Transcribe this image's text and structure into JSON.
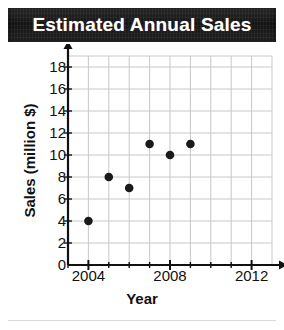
{
  "title": "Estimated Annual Sales",
  "colors": {
    "banner_background": "#141414",
    "banner_text": "#ffffff",
    "axis": "#111111",
    "grid": "#c8c8c8",
    "point": "#1a1a1a",
    "page_background": "#ffffff"
  },
  "chart_data": {
    "type": "scatter",
    "title": "Estimated Annual Sales",
    "xlabel": "Year",
    "ylabel": "Sales (million $)",
    "xlim": [
      2003,
      2013
    ],
    "ylim": [
      0,
      19
    ],
    "grid": true,
    "legend": null,
    "x_tick_labels": [
      "2004",
      "2008",
      "2012"
    ],
    "x_tick_values": [
      2004,
      2008,
      2012
    ],
    "x_minor_ticks": [
      2003,
      2004,
      2005,
      2006,
      2007,
      2008,
      2009,
      2010,
      2011,
      2012
    ],
    "y_tick_labels": [
      "0",
      "2",
      "4",
      "6",
      "8",
      "10",
      "12",
      "14",
      "16",
      "18"
    ],
    "y_tick_values": [
      0,
      2,
      4,
      6,
      8,
      10,
      12,
      14,
      16,
      18
    ],
    "x": [
      2004,
      2005,
      2006,
      2007,
      2008,
      2009
    ],
    "values": [
      4,
      8,
      7,
      11,
      10,
      11
    ],
    "points": [
      {
        "x": 2004,
        "y": 4
      },
      {
        "x": 2005,
        "y": 8
      },
      {
        "x": 2006,
        "y": 7
      },
      {
        "x": 2007,
        "y": 11
      },
      {
        "x": 2008,
        "y": 10
      },
      {
        "x": 2009,
        "y": 11
      }
    ]
  }
}
